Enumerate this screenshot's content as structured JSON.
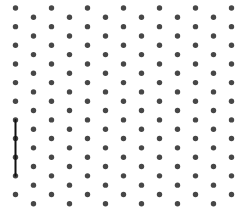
{
  "grid": {
    "type": "isometric-dot-grid",
    "columns": 13,
    "rows_per_column": 11,
    "x_start": 15.5,
    "x_step": 18,
    "even_col_y_start": 8,
    "odd_col_y_start": 17.3,
    "y_step": 18.65,
    "dot_radius": 2.7,
    "dot_color": "#474747"
  },
  "segments": [
    {
      "col": 0,
      "from_row": 6,
      "to_row": 9,
      "color": "#111111",
      "width": 2
    }
  ]
}
